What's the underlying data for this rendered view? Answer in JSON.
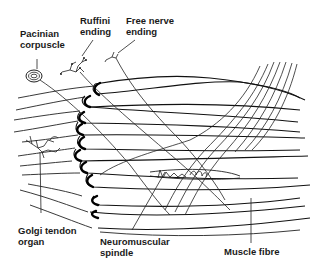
{
  "diagram": {
    "colors": {
      "ink": "#1a1a1a",
      "background": "#ffffff"
    },
    "labels": {
      "pacinian": "Pacinian\ncorpuscle",
      "ruffini": "Ruffini\nending",
      "free_nerve": "Free nerve\nending",
      "golgi": "Golgi tendon\norgan",
      "spindle": "Neuromuscular\nspindle",
      "muscle_fibre": "Muscle fibre"
    },
    "structures": [
      "pacinian-corpuscle",
      "ruffini-ending",
      "free-nerve-ending",
      "golgi-tendon-organ",
      "neuromuscular-spindle",
      "muscle-fibres",
      "tendon-junction",
      "nerve-bundle"
    ]
  }
}
